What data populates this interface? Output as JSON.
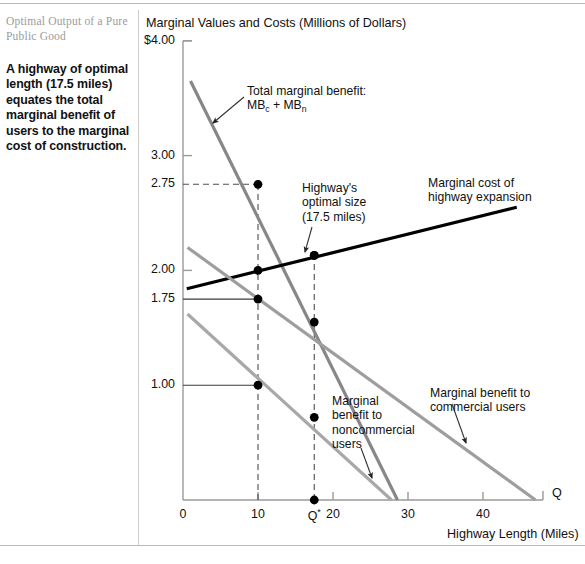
{
  "caption": {
    "title": "Optimal Output of a Pure Public Good",
    "body": "A highway of optimal length (17.5 miles) equates the total marginal benefit of users to the marginal cost of construction."
  },
  "chart_data": {
    "type": "line",
    "title": "",
    "ylabel": "Marginal Values and Costs (Millions of Dollars)",
    "xlabel": "Highway Length (Miles)",
    "x_axis_letter": "Q",
    "xlim": [
      0,
      48
    ],
    "ylim": [
      0,
      4.0
    ],
    "grid": false,
    "legend_position": "inline-annotations",
    "y_ticks": [
      {
        "value": 4.0,
        "label": "$4.00"
      },
      {
        "value": 3.0,
        "label": "3.00"
      },
      {
        "value": 2.75,
        "label": "2.75"
      },
      {
        "value": 2.0,
        "label": "2.00"
      },
      {
        "value": 1.75,
        "label": "1.75"
      },
      {
        "value": 1.0,
        "label": "1.00"
      }
    ],
    "x_ticks": [
      {
        "value": 0,
        "label": "0"
      },
      {
        "value": 10,
        "label": "10"
      },
      {
        "value": 17.5,
        "label": "Q*"
      },
      {
        "value": 20,
        "label": "20"
      },
      {
        "value": 30,
        "label": "30"
      },
      {
        "value": 40,
        "label": "40"
      }
    ],
    "series": [
      {
        "name": "Total marginal benefit: MBc + MBn",
        "color": "#878787",
        "width": 3.2,
        "points": [
          [
            1.0,
            3.65
          ],
          [
            28.6,
            0.0
          ]
        ],
        "markers": [
          [
            10,
            2.75
          ],
          [
            17.5,
            2.13
          ]
        ]
      },
      {
        "name": "Marginal cost of highway expansion",
        "color": "#000000",
        "width": 3.2,
        "points": [
          [
            0.5,
            1.84
          ],
          [
            44.5,
            2.55
          ]
        ],
        "markers": [
          [
            10,
            2.0
          ],
          [
            17.5,
            2.13
          ]
        ]
      },
      {
        "name": "Marginal benefit to commercial users",
        "color": "#9e9e9e",
        "width": 3.2,
        "points": [
          [
            0.6,
            2.2
          ],
          [
            47.0,
            0.0
          ]
        ],
        "markers": [
          [
            10,
            1.75
          ],
          [
            17.5,
            1.55
          ]
        ]
      },
      {
        "name": "Marginal benefit to noncommercial users",
        "color": "#a8a8a8",
        "width": 3.2,
        "points": [
          [
            0.6,
            1.62
          ],
          [
            27.8,
            0.0
          ]
        ],
        "markers": [
          [
            10,
            1.0
          ],
          [
            17.5,
            0.72
          ]
        ]
      }
    ],
    "guides": [
      {
        "type": "dashed-vertical",
        "x": 10,
        "from_y": 0,
        "to_y": 2.75
      },
      {
        "type": "dashed-vertical",
        "x": 17.5,
        "from_y": 0,
        "to_y": 2.13
      },
      {
        "type": "dashed-horizontal",
        "y": 2.75,
        "from_x": 0,
        "to_x": 10
      },
      {
        "type": "solid-horizontal",
        "y": 1.75,
        "from_x": 0,
        "to_x": 10
      },
      {
        "type": "solid-horizontal",
        "y": 1.0,
        "from_x": 0,
        "to_x": 10
      }
    ],
    "annotations": [
      {
        "name": "total-marginal-benefit",
        "text": "Total marginal benefit:\nMBc + MBn",
        "x": 247,
        "y": 84
      },
      {
        "name": "highway-optimal-size",
        "text": "Highway's\noptimal size\n(17.5 miles)",
        "x": 302,
        "y": 181
      },
      {
        "name": "marginal-cost",
        "text": "Marginal cost of\nhighway expansion",
        "x": 428,
        "y": 176
      },
      {
        "name": "marginal-benefit-noncommercial",
        "text": "Marginal\nbenefit to\nnoncommercial\nusers",
        "x": 332,
        "y": 394
      },
      {
        "name": "marginal-benefit-commercial",
        "text": "Marginal benefit to\ncommercial users",
        "x": 430,
        "y": 386
      }
    ]
  }
}
